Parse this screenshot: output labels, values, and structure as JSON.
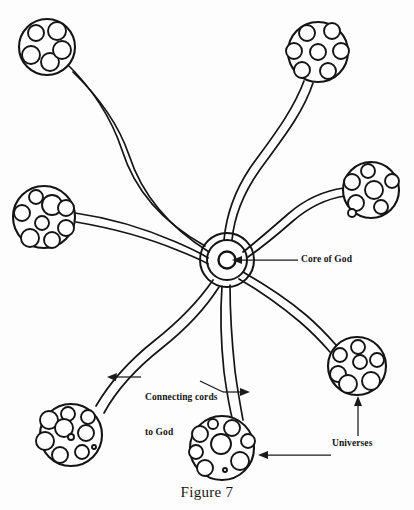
{
  "figure": {
    "caption": "Figure 7"
  },
  "labels": {
    "core": "Core of God",
    "cords_line1": "Connecting cords",
    "cords_line2": "to God",
    "universes": "Universes"
  },
  "colors": {
    "ink": "#141414",
    "paper": "#fdfdfd",
    "leader": "#1a1a1a"
  },
  "diagram_data": {
    "type": "node-link",
    "core": {
      "name": "Core of God",
      "cx": 227,
      "cy": 260,
      "rings": [
        8,
        20,
        27
      ]
    },
    "universes": [
      {
        "id": "universe-top-left",
        "cx": 47,
        "cy": 47,
        "r": 28,
        "cell_count": 5,
        "cells": [
          {
            "cx": 36,
            "cy": 33,
            "r": 8
          },
          {
            "cx": 57,
            "cy": 31,
            "r": 9
          },
          {
            "cx": 31,
            "cy": 55,
            "r": 9
          },
          {
            "cx": 50,
            "cy": 62,
            "r": 9
          },
          {
            "cx": 62,
            "cy": 50,
            "r": 9
          }
        ]
      },
      {
        "id": "universe-top-right",
        "cx": 318,
        "cy": 52,
        "r": 30,
        "cell_count": 7,
        "cells": [
          {
            "cx": 307,
            "cy": 33,
            "r": 8
          },
          {
            "cx": 332,
            "cy": 31,
            "r": 8
          },
          {
            "cx": 294,
            "cy": 51,
            "r": 8
          },
          {
            "cx": 318,
            "cy": 52,
            "r": 8
          },
          {
            "cx": 341,
            "cy": 51,
            "r": 8
          },
          {
            "cx": 302,
            "cy": 70,
            "r": 8
          },
          {
            "cx": 328,
            "cy": 71,
            "r": 8
          }
        ]
      },
      {
        "id": "universe-left",
        "cx": 44,
        "cy": 217,
        "r": 31,
        "cell_count": 8,
        "cells": [
          {
            "cx": 36,
            "cy": 197,
            "r": 7
          },
          {
            "cx": 52,
            "cy": 205,
            "r": 10
          },
          {
            "cx": 22,
            "cy": 213,
            "r": 8
          },
          {
            "cx": 66,
            "cy": 208,
            "r": 8
          },
          {
            "cx": 42,
            "cy": 223,
            "r": 7
          },
          {
            "cx": 66,
            "cy": 228,
            "r": 8
          },
          {
            "cx": 30,
            "cy": 238,
            "r": 9
          },
          {
            "cx": 52,
            "cy": 240,
            "r": 8
          }
        ]
      },
      {
        "id": "universe-right-upper",
        "cx": 371,
        "cy": 190,
        "r": 28,
        "cell_count": 7,
        "cells": [
          {
            "cx": 368,
            "cy": 171,
            "r": 7
          },
          {
            "cx": 352,
            "cy": 182,
            "r": 8
          },
          {
            "cx": 374,
            "cy": 190,
            "r": 9
          },
          {
            "cx": 392,
            "cy": 181,
            "r": 7
          },
          {
            "cx": 356,
            "cy": 203,
            "r": 8
          },
          {
            "cx": 352,
            "cy": 213,
            "r": 4
          },
          {
            "cx": 381,
            "cy": 207,
            "r": 7
          }
        ]
      },
      {
        "id": "universe-right-lower",
        "cx": 357,
        "cy": 366,
        "r": 29,
        "cell_count": 7,
        "cells": [
          {
            "cx": 358,
            "cy": 347,
            "r": 7
          },
          {
            "cx": 340,
            "cy": 355,
            "r": 7
          },
          {
            "cx": 360,
            "cy": 362,
            "r": 7
          },
          {
            "cx": 377,
            "cy": 360,
            "r": 7
          },
          {
            "cx": 338,
            "cy": 374,
            "r": 8
          },
          {
            "cx": 348,
            "cy": 384,
            "r": 9
          },
          {
            "cx": 371,
            "cy": 381,
            "r": 9
          }
        ]
      },
      {
        "id": "universe-bottom-left",
        "cx": 71,
        "cy": 435,
        "r": 31,
        "cell_count": 10,
        "cells": [
          {
            "cx": 68,
            "cy": 414,
            "r": 7
          },
          {
            "cx": 88,
            "cy": 417,
            "r": 7
          },
          {
            "cx": 49,
            "cy": 420,
            "r": 9
          },
          {
            "cx": 64,
            "cy": 428,
            "r": 9
          },
          {
            "cx": 86,
            "cy": 433,
            "r": 8
          },
          {
            "cx": 71,
            "cy": 437,
            "r": 3
          },
          {
            "cx": 45,
            "cy": 441,
            "r": 9
          },
          {
            "cx": 82,
            "cy": 452,
            "r": 7
          },
          {
            "cx": 60,
            "cy": 455,
            "r": 8
          },
          {
            "cx": 94,
            "cy": 447,
            "r": 2
          }
        ]
      },
      {
        "id": "universe-bottom-center",
        "cx": 222,
        "cy": 448,
        "r": 32,
        "cell_count": 9,
        "cells": [
          {
            "cx": 213,
            "cy": 424,
            "r": 5
          },
          {
            "cx": 232,
            "cy": 428,
            "r": 8
          },
          {
            "cx": 200,
            "cy": 434,
            "r": 8
          },
          {
            "cx": 248,
            "cy": 441,
            "r": 7
          },
          {
            "cx": 221,
            "cy": 444,
            "r": 10
          },
          {
            "cx": 196,
            "cy": 452,
            "r": 7
          },
          {
            "cx": 240,
            "cy": 461,
            "r": 9
          },
          {
            "cx": 205,
            "cy": 468,
            "r": 8
          },
          {
            "cx": 225,
            "cy": 470,
            "r": 2
          }
        ]
      }
    ],
    "cords": [
      {
        "id": "cord-to-top-left",
        "from": "core",
        "to": "universe-top-left"
      },
      {
        "id": "cord-to-top-right",
        "from": "core",
        "to": "universe-top-right"
      },
      {
        "id": "cord-to-left",
        "from": "core",
        "to": "universe-left"
      },
      {
        "id": "cord-to-right-upper",
        "from": "core",
        "to": "universe-right-upper"
      },
      {
        "id": "cord-to-right-lower",
        "from": "core",
        "to": "universe-right-lower"
      },
      {
        "id": "cord-to-bottom-left",
        "from": "core",
        "to": "universe-bottom-left"
      },
      {
        "id": "cord-to-bottom-center",
        "from": "core",
        "to": "universe-bottom-center"
      }
    ],
    "annotations": [
      {
        "id": "annotation-core",
        "label": "Core of God",
        "points_to": "core"
      },
      {
        "id": "annotation-cords",
        "label": "Connecting cords to God",
        "points_to": [
          "cord-to-bottom-left",
          "cord-to-bottom-center"
        ]
      },
      {
        "id": "annotation-universes",
        "label": "Universes",
        "points_to": [
          "universe-right-lower",
          "universe-bottom-center"
        ]
      }
    ]
  }
}
